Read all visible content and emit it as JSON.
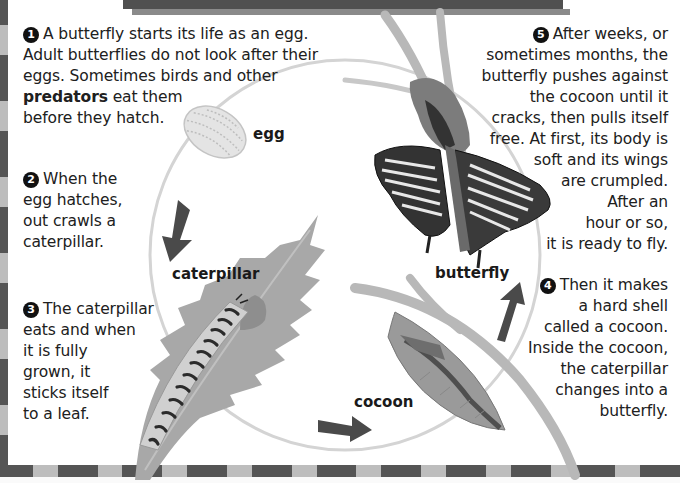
{
  "colors": {
    "border_dark": "#555555",
    "border_light": "#bdbdbd",
    "header_bar": "#505050",
    "cycle_line": "#d4d4d4",
    "arrow": "#4a4a4a",
    "leaf": "#a8a8a8",
    "text": "#202020"
  },
  "steps": [
    {
      "number": "1",
      "lines": [
        "A butterfly starts its life as an egg.",
        "Adult butterflies do not look after their",
        "eggs. Sometimes birds and other"
      ],
      "bold_term": "predators",
      "after_bold": " eat them",
      "last_line": "before they hatch."
    },
    {
      "number": "2",
      "lines": [
        "When the",
        "egg hatches,",
        "out crawls a",
        "caterpillar."
      ]
    },
    {
      "number": "3",
      "lines": [
        "The caterpillar",
        "eats and when",
        "it is fully",
        "grown, it",
        "sticks itself",
        "to a leaf."
      ]
    },
    {
      "number": "4",
      "lines": [
        "Then it makes",
        "a hard shell",
        "called a cocoon.",
        "Inside the cocoon,",
        "the caterpillar",
        "changes into a",
        "butterfly."
      ]
    },
    {
      "number": "5",
      "lines": [
        "After weeks, or",
        "sometimes months, the",
        "butterfly pushes against",
        "the cocoon until it",
        "cracks, then pulls itself",
        "free. At first, its body is",
        "soft and its wings",
        "are crumpled.",
        "After an",
        "hour or so,",
        "it is ready to fly."
      ]
    }
  ],
  "cycle_labels": {
    "egg": "egg",
    "caterpillar": "caterpillar",
    "cocoon": "cocoon",
    "butterfly": "butterfly"
  },
  "icons": {
    "egg": "egg-illustration",
    "caterpillar": "caterpillar-on-leaf-illustration",
    "cocoon": "cocoon-illustration",
    "butterfly": "butterfly-illustration",
    "arrows": "cycle-arrow"
  }
}
